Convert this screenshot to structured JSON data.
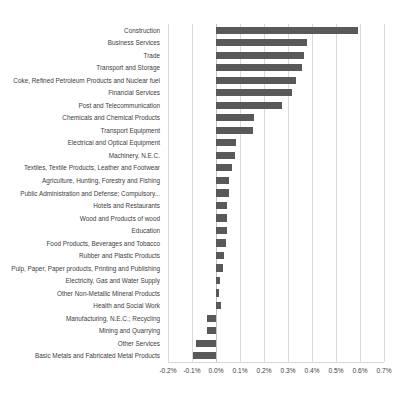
{
  "chart_data": {
    "type": "bar",
    "orientation": "horizontal",
    "title": "",
    "subtitle": "",
    "xlabel": "",
    "ylabel": "",
    "xlim": [
      -0.2,
      0.7
    ],
    "xtick_values": [
      -0.2,
      -0.1,
      0.0,
      0.1,
      0.2,
      0.3,
      0.4,
      0.5,
      0.6,
      0.7
    ],
    "xtick_labels": [
      "-0.2%",
      "-0.1%",
      "0.0%",
      "0.1%",
      "0.2%",
      "0.3%",
      "0.4%",
      "0.5%",
      "0.6%",
      "0.7%"
    ],
    "grid": true,
    "legend": false,
    "bar_color": "#595959",
    "gridline_color": "#d9d9d9",
    "unit": "%",
    "categories": [
      "Construction",
      "Business Services",
      "Trade",
      "Transport and Storage",
      "Coke, Refined Petroleum Products and Nuclear fuel",
      "Financial Services",
      "Post and Telecommunication",
      "Chemicals and  Chemical Products",
      "Transport Equipment",
      "Electrical and Optical Equipment",
      "Machinery, N.E.C.",
      "Textiles, Textile Products, Leather and Footwear",
      "Agriculture, Hunting, Forestry and Fishing",
      "Public Administration and Defense; Compulsory...",
      "Hotels and Restaurants",
      "Wood and Products of wood",
      "Education",
      "Food Products, Beverages and Tobacco",
      "Rubber and Plastic Products",
      "Pulp, Paper, Paper products, Printing and Publishing",
      "Electricity, Gas and Water Supply",
      "Other Non-Metallic Mineral Products",
      "Health and Social Work",
      "Manufacturing, N.E.C.; Recycling",
      "Mining and Quarrying",
      "Other Services",
      "Basic Metals and Fabricated Metal Products"
    ],
    "values": [
      0.59,
      0.38,
      0.365,
      0.36,
      0.335,
      0.315,
      0.275,
      0.16,
      0.155,
      0.085,
      0.08,
      0.065,
      0.055,
      0.055,
      0.045,
      0.045,
      0.045,
      0.04,
      0.032,
      0.03,
      0.018,
      0.012,
      0.022,
      -0.038,
      -0.038,
      -0.082,
      -0.097
    ]
  }
}
